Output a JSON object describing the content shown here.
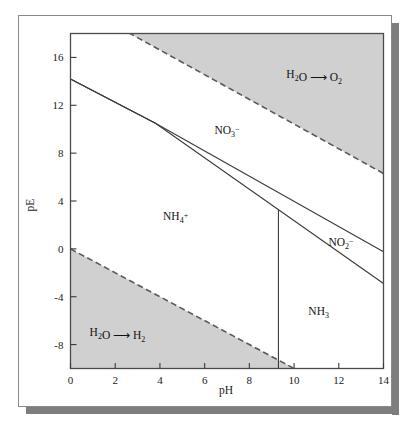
{
  "figure": {
    "kind": "pE-pH predominance diagram",
    "background_color": "#ffffff",
    "border_color": "#8a8a8a",
    "shadow_color": "#7e7e7e"
  },
  "chart_data": {
    "type": "line",
    "title": "",
    "xlabel": "pH",
    "ylabel": "pE",
    "xlim": [
      0,
      14
    ],
    "ylim": [
      -10,
      18
    ],
    "xticks": [
      0,
      2,
      4,
      6,
      8,
      10,
      12,
      14
    ],
    "xtick_labels": [
      "0",
      "2",
      "4",
      "6",
      "8",
      "10",
      "12",
      "14"
    ],
    "yticks": [
      -8,
      -4,
      0,
      4,
      8,
      12,
      16
    ],
    "ytick_labels": [
      "-8",
      "-4",
      "0",
      "4",
      "8",
      "12",
      "16"
    ],
    "grid": false,
    "legend": false,
    "shaded_color": "#d0d0d0",
    "line_color": "#3a3a3a",
    "series": [
      {
        "name": "water-oxidation-boundary",
        "style": "dashed",
        "comment": "upper stability limit of water; O2 evolution above",
        "x": [
          0,
          14
        ],
        "y": [
          20.75,
          6.3
        ]
      },
      {
        "name": "water-reduction-boundary",
        "style": "dashed",
        "comment": "lower stability limit of water; H2 evolution below",
        "x": [
          0,
          14
        ],
        "y": [
          0,
          -14
        ]
      },
      {
        "name": "NO3--NO2--boundary",
        "style": "solid",
        "comment": "upper solid line: nitrate / nitrite equilibrium",
        "x": [
          0,
          3.8,
          14
        ],
        "y": [
          14.2,
          10.5,
          -0.25
        ]
      },
      {
        "name": "NO2--NH4+-NH3-boundary",
        "style": "solid",
        "comment": "lower solid line: nitrite / ammonium-ammonia equilibrium",
        "x": [
          0,
          3.8,
          14
        ],
        "y": [
          14.2,
          10.5,
          -2.9
        ]
      },
      {
        "name": "NH4+-NH3-boundary",
        "style": "solid-vertical",
        "comment": "vertical line at the ammonium/ammonia pKa",
        "x": [
          9.3,
          9.3
        ],
        "y": [
          3.25,
          -10
        ]
      }
    ],
    "annotations": [
      {
        "name": "oxygen-region-label",
        "text": "H2O -> O2",
        "parts": [
          {
            "t": "H",
            "k": "n"
          },
          {
            "t": "2",
            "k": "sub"
          },
          {
            "t": "O ",
            "k": "n"
          },
          {
            "t": "⟶",
            "k": "arrow"
          },
          {
            "t": " O",
            "k": "n"
          },
          {
            "t": "2",
            "k": "sub"
          }
        ],
        "x": 10.9,
        "y": 14.3
      },
      {
        "name": "hydrogen-region-label",
        "text": "H2O -> H2",
        "parts": [
          {
            "t": "H",
            "k": "n"
          },
          {
            "t": "2",
            "k": "sub"
          },
          {
            "t": "O ",
            "k": "n"
          },
          {
            "t": "⟶",
            "k": "arrow"
          },
          {
            "t": " H",
            "k": "n"
          },
          {
            "t": "2",
            "k": "sub"
          }
        ],
        "x": 2.1,
        "y": -7.3
      },
      {
        "name": "nitrate-region-label",
        "text": "NO3-",
        "parts": [
          {
            "t": "NO",
            "k": "n"
          },
          {
            "t": "3",
            "k": "sub"
          },
          {
            "t": "−",
            "k": "sup"
          }
        ],
        "x": 7.0,
        "y": 9.6
      },
      {
        "name": "nitrite-region-label",
        "text": "NO2-",
        "parts": [
          {
            "t": "NO",
            "k": "n"
          },
          {
            "t": "2",
            "k": "sub"
          },
          {
            "t": "−",
            "k": "sup"
          }
        ],
        "x": 12.1,
        "y": 0.2
      },
      {
        "name": "ammonium-region-label",
        "text": "NH4+",
        "parts": [
          {
            "t": "NH",
            "k": "n"
          },
          {
            "t": "4",
            "k": "sub"
          },
          {
            "t": "+",
            "k": "sup"
          }
        ],
        "x": 4.7,
        "y": 2.4
      },
      {
        "name": "ammonia-region-label",
        "text": "NH3",
        "parts": [
          {
            "t": "NH",
            "k": "n"
          },
          {
            "t": "3",
            "k": "sub"
          }
        ],
        "x": 11.1,
        "y": -5.5
      }
    ]
  }
}
